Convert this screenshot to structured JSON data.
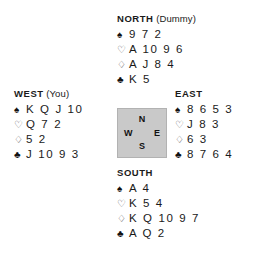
{
  "diagram": {
    "type": "bridge-deal",
    "compass": {
      "north": "N",
      "south": "S",
      "west": "W",
      "east": "E",
      "fill_color": "#c9c9c9",
      "border_color": "#b2b2b2"
    },
    "suit_symbols": {
      "spade": "♠",
      "heart": "♡",
      "diamond": "♢",
      "club": "♣"
    },
    "hands": {
      "north": {
        "seat": "NORTH",
        "note": "(Dummy)",
        "spades": "9 7 2",
        "hearts": "A 10 9 6",
        "diamonds": "A J 8 4",
        "clubs": "K 5"
      },
      "west": {
        "seat": "WEST",
        "note": "(You)",
        "spades": "K Q J 10",
        "hearts": "Q 7 2",
        "diamonds": "5 2",
        "clubs": "J 10 9 3"
      },
      "east": {
        "seat": "EAST",
        "note": "",
        "spades": "8 6 5 3",
        "hearts": "J 8 3",
        "diamonds": "6 3",
        "clubs": "8 7 6 4"
      },
      "south": {
        "seat": "SOUTH",
        "note": "",
        "spades": "A 4",
        "hearts": "K 5 4",
        "diamonds": "K Q 10 9 7",
        "clubs": "A Q 2"
      }
    }
  }
}
